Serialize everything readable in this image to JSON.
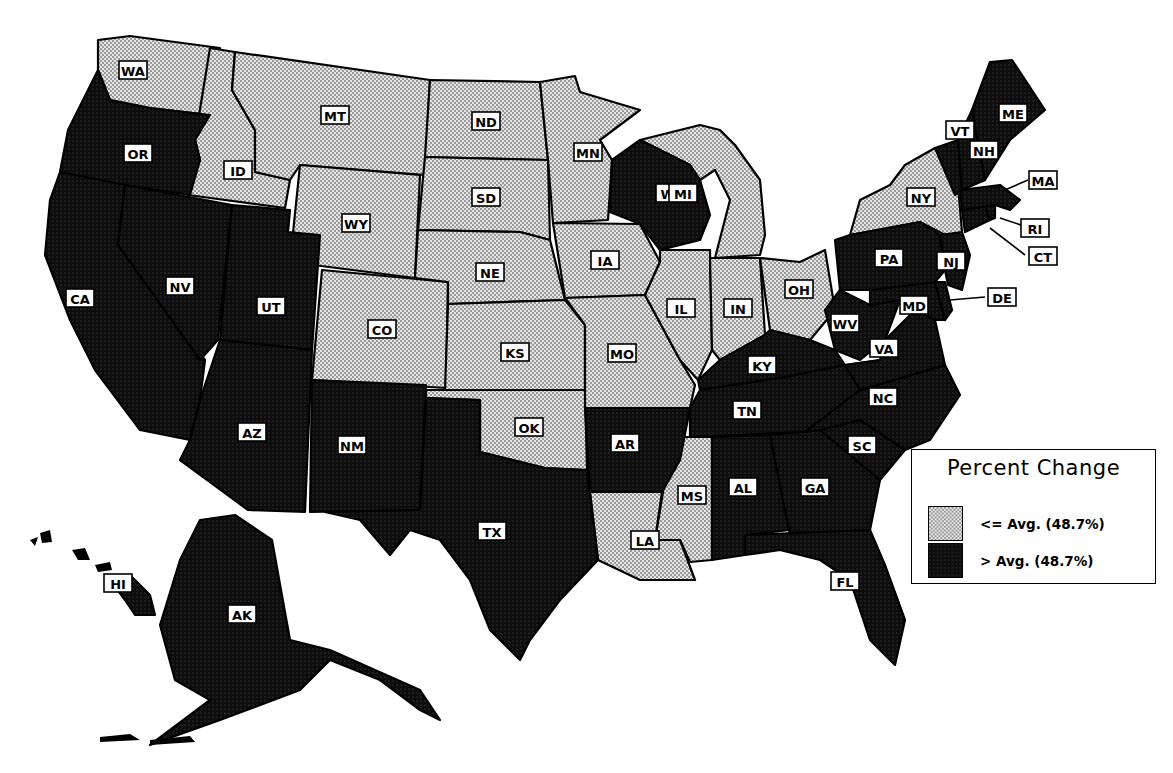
{
  "caption": {
    "text_visible": "",
    "note": "top caption line is cropped; only descenders visible"
  },
  "legend": {
    "title": "Percent Change",
    "items": [
      {
        "key": "low",
        "label": "<= Avg. (48.7%)",
        "pattern": "light-dotted"
      },
      {
        "key": "high",
        "label": "> Avg. (48.7%)",
        "pattern": "dark-dotted"
      }
    ]
  },
  "colors": {
    "low_fill": "#d9d9d9",
    "high_fill": "#111111",
    "outline": "#000000",
    "label_bg": "#ffffff"
  },
  "chart_data": {
    "type": "choropleth",
    "title": "Percent Change",
    "threshold_label": "Avg. (48.7%)",
    "threshold_value": 48.7,
    "categories": [
      "<= Avg. (48.7%)",
      "> Avg. (48.7%)"
    ],
    "states_at_or_below_avg": [
      "WA",
      "ID",
      "MT",
      "WY",
      "CO",
      "ND",
      "SD",
      "NE",
      "KS",
      "OK",
      "MN",
      "IA",
      "MO",
      "IL",
      "IN",
      "MI",
      "OH",
      "NY",
      "MS",
      "LA"
    ],
    "states_above_avg": [
      "OR",
      "CA",
      "NV",
      "UT",
      "AZ",
      "NM",
      "TX",
      "AR",
      "WI",
      "KY",
      "TN",
      "AL",
      "GA",
      "FL",
      "SC",
      "NC",
      "VA",
      "WV",
      "MD",
      "DE",
      "PA",
      "NJ",
      "CT",
      "RI",
      "MA",
      "VT",
      "NH",
      "ME",
      "AK",
      "HI"
    ],
    "legend_position": "lower-right"
  },
  "labels": {
    "WA": "WA",
    "OR": "OR",
    "CA": "CA",
    "ID": "ID",
    "NV": "NV",
    "UT": "UT",
    "AZ": "AZ",
    "MT": "MT",
    "WY": "WY",
    "CO": "CO",
    "NM": "NM",
    "ND": "ND",
    "SD": "SD",
    "NE": "NE",
    "KS": "KS",
    "OK": "OK",
    "TX": "TX",
    "MN": "MN",
    "IA": "IA",
    "MO": "MO",
    "AR": "AR",
    "LA": "LA",
    "WI": "WI",
    "IL": "IL",
    "MI": "MI",
    "IN": "IN",
    "OH": "OH",
    "KY": "KY",
    "TN": "TN",
    "MS": "MS",
    "AL": "AL",
    "GA": "GA",
    "FL": "FL",
    "SC": "SC",
    "NC": "NC",
    "VA": "VA",
    "WV": "WV",
    "MD": "MD",
    "DE": "DE",
    "PA": "PA",
    "NJ": "NJ",
    "NY": "NY",
    "CT": "CT",
    "RI": "RI",
    "MA": "MA",
    "VT": "VT",
    "NH": "NH",
    "ME": "ME",
    "AK": "AK",
    "HI": "HI"
  }
}
